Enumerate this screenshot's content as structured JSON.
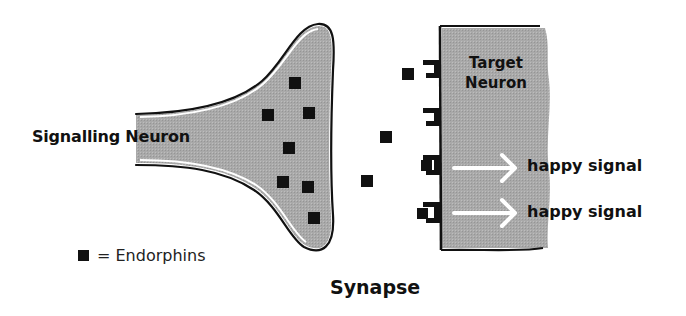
{
  "diagram": {
    "title": "Synapse",
    "signalling_neuron": {
      "label": "Signalling Neuron"
    },
    "target_neuron": {
      "label_line1": "Target",
      "label_line2": "Neuron"
    },
    "signals": [
      {
        "label": "happy signal"
      },
      {
        "label": "happy signal"
      }
    ],
    "legend": {
      "symbol": "black-square",
      "text": "= Endorphins"
    },
    "endorphins": {
      "inside_signalling_neuron": 7,
      "in_synaptic_gap": 3,
      "bound_to_receptors": 2
    },
    "receptors": {
      "count": 4,
      "bound": 2
    },
    "colors": {
      "neuron_fill": "#a8a8a8",
      "outline": "#111111",
      "endorphin": "#111111",
      "arrow": "#ffffff"
    }
  }
}
